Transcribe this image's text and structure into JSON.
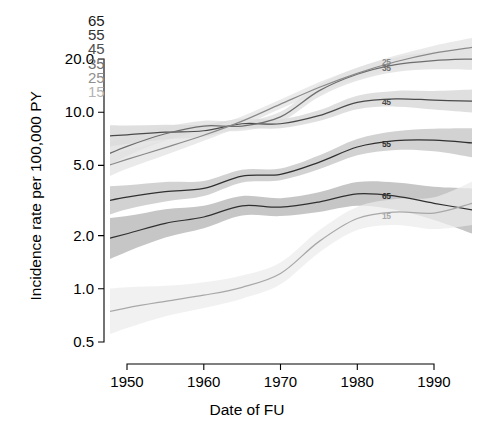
{
  "chart_data": {
    "type": "line",
    "title": "",
    "xlabel": "Date of FU",
    "ylabel": "Incidence rate per 100,000 PY",
    "xlim": [
      1945,
      1995
    ],
    "ylim": [
      0.45,
      25
    ],
    "yscale": "log",
    "xticks": [
      1950,
      1960,
      1970,
      1980,
      1990
    ],
    "xticklabels": [
      "1950",
      "1960",
      "1970",
      "1980",
      "1990"
    ],
    "yticks": [
      0.5,
      1.0,
      2.0,
      5.0,
      10.0,
      20.0
    ],
    "yticklabels": [
      "0.5",
      "1.0",
      "2.0",
      "5.0",
      "10.0",
      "20.0"
    ],
    "grid": false,
    "legend_position": "top-left",
    "legend_title": "",
    "band_description": "shaded grey confidence bands around each curve",
    "series": [
      {
        "name": "65",
        "label": "65",
        "color": "#303030",
        "shade": "#b0b0b0",
        "inline_label_x": 1984,
        "inline_label_y": 3.35,
        "x": [
          1945,
          1950,
          1955,
          1960,
          1965,
          1970,
          1975,
          1980,
          1985,
          1990,
          1995
        ],
        "values": [
          1.8,
          2.05,
          2.35,
          2.55,
          2.95,
          2.9,
          3.1,
          3.45,
          3.35,
          3.05,
          2.8
        ],
        "lower": [
          1.3,
          1.62,
          1.95,
          2.2,
          2.6,
          2.58,
          2.72,
          2.95,
          2.8,
          2.45,
          2.05
        ],
        "upper": [
          2.45,
          2.58,
          2.82,
          2.95,
          3.35,
          3.26,
          3.52,
          4.02,
          4.0,
          3.78,
          3.7
        ]
      },
      {
        "name": "55",
        "label": "55",
        "color": "#303030",
        "shade": "#c0c0c0",
        "inline_label_x": 1984,
        "inline_label_y": 6.55,
        "x": [
          1945,
          1950,
          1955,
          1960,
          1965,
          1970,
          1975,
          1980,
          1985,
          1990,
          1995
        ],
        "values": [
          3.0,
          3.3,
          3.55,
          3.7,
          4.35,
          4.45,
          5.2,
          6.35,
          6.9,
          6.95,
          6.7
        ],
        "lower": [
          2.4,
          2.82,
          3.12,
          3.35,
          4.0,
          4.12,
          4.75,
          5.7,
          6.1,
          6.0,
          5.55
        ],
        "upper": [
          3.75,
          3.86,
          4.03,
          4.08,
          4.72,
          4.8,
          5.68,
          7.05,
          7.8,
          8.05,
          8.1
        ]
      },
      {
        "name": "45",
        "label": "45",
        "color": "#4a4a4a",
        "shade": "#d2d2d2",
        "inline_label_x": 1984,
        "inline_label_y": 11.3,
        "x": [
          1945,
          1950,
          1955,
          1960,
          1965,
          1970,
          1975,
          1980,
          1985,
          1990,
          1995
        ],
        "values": [
          7.2,
          7.45,
          7.7,
          7.85,
          8.6,
          8.6,
          9.55,
          11.35,
          11.9,
          11.7,
          11.55
        ],
        "lower": [
          6.1,
          6.6,
          7.0,
          7.25,
          8.05,
          8.1,
          8.9,
          10.4,
          10.75,
          10.35,
          9.95
        ],
        "upper": [
          8.5,
          8.4,
          8.48,
          8.5,
          9.2,
          9.13,
          10.25,
          12.4,
          13.2,
          13.2,
          13.45
        ]
      },
      {
        "name": "35",
        "label": "35",
        "color": "#6e6e6e",
        "shade": "#dcdcdc",
        "inline_label_x": 1984,
        "inline_label_y": 17.6,
        "x": [
          1945,
          1950,
          1955,
          1960,
          1965,
          1970,
          1975,
          1980,
          1985,
          1990,
          1995
        ],
        "values": [
          5.2,
          6.4,
          7.55,
          8.35,
          8.35,
          9.4,
          13.2,
          16.4,
          18.6,
          19.6,
          20.0
        ],
        "lower": [
          4.3,
          5.65,
          6.9,
          7.8,
          7.85,
          8.8,
          12.2,
          15.05,
          16.9,
          17.5,
          17.4
        ],
        "upper": [
          6.3,
          7.25,
          8.26,
          8.94,
          8.88,
          10.04,
          14.28,
          17.87,
          20.47,
          21.95,
          23.0
        ]
      },
      {
        "name": "25",
        "label": "25",
        "color": "#8a8a8a",
        "shade": "#e2e2e2",
        "inline_label_x": 1984,
        "inline_label_y": 19.2,
        "x": [
          1945,
          1950,
          1955,
          1960,
          1965,
          1970,
          1975,
          1980,
          1985,
          1990,
          1995
        ],
        "values": [
          4.6,
          5.4,
          6.3,
          7.4,
          8.9,
          11.1,
          13.8,
          16.6,
          19.3,
          21.6,
          23.3
        ],
        "lower": [
          3.85,
          4.78,
          5.72,
          6.88,
          8.35,
          10.45,
          12.9,
          15.45,
          17.8,
          19.6,
          20.6
        ],
        "upper": [
          5.5,
          6.1,
          6.94,
          7.96,
          9.49,
          11.79,
          14.76,
          17.84,
          20.93,
          23.8,
          26.35
        ]
      },
      {
        "name": "15",
        "label": "15",
        "color": "#a8a8a8",
        "shade": "#ebebeb",
        "inline_label_x": 1984,
        "inline_label_y": 2.58,
        "x": [
          1945,
          1950,
          1955,
          1960,
          1965,
          1970,
          1975,
          1980,
          1985,
          1990,
          1995
        ],
        "values": [
          0.7,
          0.78,
          0.85,
          0.92,
          1.02,
          1.22,
          1.85,
          2.5,
          2.72,
          2.68,
          3.05
        ],
        "lower": [
          0.5,
          0.6,
          0.7,
          0.78,
          0.88,
          1.06,
          1.6,
          2.15,
          2.3,
          2.18,
          2.3
        ],
        "upper": [
          0.98,
          1.02,
          1.04,
          1.09,
          1.19,
          1.41,
          2.14,
          2.91,
          3.22,
          3.3,
          4.05
        ]
      }
    ]
  },
  "legend": {
    "items": [
      {
        "label": "65",
        "color": "#1a1a1a"
      },
      {
        "label": "55",
        "color": "#343434"
      },
      {
        "label": "45",
        "color": "#4f4f4f"
      },
      {
        "label": "35",
        "color": "#6e6e6e"
      },
      {
        "label": "25",
        "color": "#8f8f8f"
      },
      {
        "label": "15",
        "color": "#b4b4b4"
      }
    ]
  },
  "axes": {
    "x_title": "Date of FU",
    "y_title": "Incidence rate per 100,000 PY"
  }
}
